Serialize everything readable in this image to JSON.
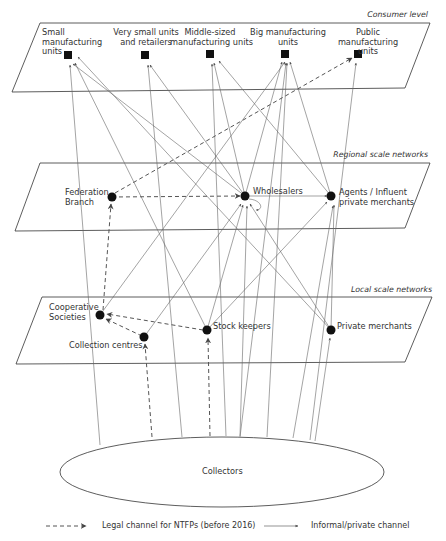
{
  "levels": {
    "consumer": "Consumer level",
    "regional": "Regional scale networks",
    "local": "Local scale networks"
  },
  "consumer_nodes": {
    "small": "Small manufacturing units",
    "small_l1": "Small",
    "small_l2": "manufacturing",
    "small_l3": "units",
    "very_small_l1": "Very small units",
    "very_small_l2": "and retailers",
    "middle_l1": "Middle-sized",
    "middle_l2": "manufacturing units",
    "big_l1": "Big manufacturing",
    "big_l2": "units",
    "public_l1": "Public",
    "public_l2": "manufacturing",
    "public_l3": "units"
  },
  "regional_nodes": {
    "federation_l1": "Federation",
    "federation_l2": "Branch",
    "wholesalers": "Wholesalers",
    "agents_l1": "Agents / Influent",
    "agents_l2": "private merchants"
  },
  "local_nodes": {
    "cooperative_l1": "Cooperative",
    "cooperative_l2": "Societies",
    "collection": "Collection centres",
    "stock": "Stock keepers",
    "private": "Private merchants"
  },
  "source": {
    "collectors": "Collectors"
  },
  "legend": {
    "legal": "Legal channel for NTFPs (before 2016)",
    "informal": "Informal/private channel"
  },
  "colors": {
    "line": "#555555",
    "node": "#111111",
    "arrow": "#444444"
  }
}
